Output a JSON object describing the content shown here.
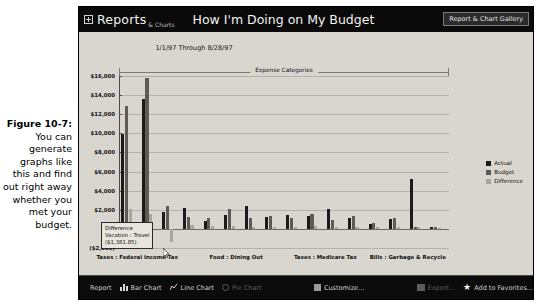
{
  "caption": {
    "figure_number": "Figure 10-7:",
    "text": "You can generate graphs like this and find out right away whether you met your budget."
  },
  "titlebar": {
    "app_name": "Reports",
    "app_sub": "& Charts",
    "document_title": "How I'm Doing on My Budget",
    "gallery_button": "Report & Chart Gallery",
    "icon": "expand-box-icon"
  },
  "chart_data": {
    "type": "bar",
    "title": "How I'm Doing on My Budget",
    "subtitle": "1/1/97 Through 8/28/97",
    "band_label": "Expense Categories",
    "xlabel": "",
    "ylabel": "",
    "ylim": [
      -2000,
      16000
    ],
    "grid": true,
    "legend_position": "right",
    "ytick_labels": [
      "$16,000",
      "$14,000",
      "$12,000",
      "$10,000",
      "$8,000",
      "$6,000",
      "$4,000",
      "$2,000",
      "($2,000)"
    ],
    "ytick_values": [
      16000,
      14000,
      12000,
      10000,
      8000,
      6000,
      4000,
      2000,
      -2000
    ],
    "axis_labels": [
      "Taxes : Federal Income Tax",
      "Food : Dining Out",
      "Taxes : Medicare Tax",
      "Bills : Garbage & Recycle"
    ],
    "axis_label_positions": [
      0.055,
      0.355,
      0.625,
      0.875
    ],
    "series": [
      {
        "name": "Actual",
        "color": "#1b1b1b",
        "values": [
          9900,
          13600,
          1750,
          2150,
          800,
          1500,
          2400,
          1200,
          1450,
          1300,
          2050,
          1150,
          500,
          1000,
          5200,
          250
        ]
      },
      {
        "name": "Budget",
        "color": "#5e5b57",
        "values": [
          12900,
          15800,
          2350,
          1250,
          1150,
          2100,
          1100,
          1350,
          1100,
          1600,
          900,
          1300,
          600,
          1150,
          200,
          200
        ]
      },
      {
        "name": "Difference",
        "color": "#a9a6a0",
        "values": [
          2050,
          1550,
          -1381,
          400,
          350,
          300,
          250,
          200,
          200,
          300,
          250,
          200,
          150,
          150,
          250,
          100
        ]
      }
    ],
    "categories": [
      "Taxes : Federal Income Tax",
      "Cat 2",
      "Vacation : Travel",
      "Cat 4",
      "Cat 5",
      "Cat 6",
      "Food : Dining Out",
      "Cat 8",
      "Cat 9",
      "Cat 10",
      "Cat 11",
      "Taxes : Medicare Tax",
      "Cat 13",
      "Cat 14",
      "Bills : Garbage & Recycle",
      "Cat 16"
    ]
  },
  "legend": [
    {
      "label": "Actual",
      "color": "#1b1b1b"
    },
    {
      "label": "Budget",
      "color": "#5e5b57"
    },
    {
      "label": "Difference",
      "color": "#a9a6a0"
    }
  ],
  "tooltip": {
    "series": "Difference",
    "category": "Vacation : Travel",
    "value": "($1,381.85)"
  },
  "toolbar": {
    "items": [
      {
        "label": "Report",
        "icon": "report-icon",
        "enabled": true
      },
      {
        "label": "Bar Chart",
        "icon": "bar-chart-icon",
        "enabled": true
      },
      {
        "label": "Line Chart",
        "icon": "line-chart-icon",
        "enabled": true
      },
      {
        "label": "Pie Chart",
        "icon": "pie-chart-icon",
        "enabled": false
      },
      {
        "label": "Customize...",
        "icon": "customize-icon",
        "enabled": true
      },
      {
        "label": "Export...",
        "icon": "export-icon",
        "enabled": false
      },
      {
        "label": "Add to Favorites...",
        "icon": "star-icon",
        "enabled": true
      }
    ]
  }
}
